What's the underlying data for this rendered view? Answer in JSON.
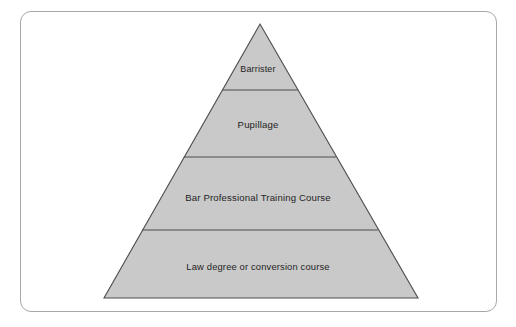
{
  "figure": {
    "kind": "pyramid-diagram",
    "title": "",
    "background_color": "#ffffff",
    "frame": {
      "border_color": "#a8a8a8",
      "corner_radius": 11,
      "fill_color": "#ffffff"
    },
    "pyramid": {
      "fill_color": "#c9c9c9",
      "outline_color": "#4d4d4d",
      "divider_color": "#4d4d4d",
      "apex": {
        "x": 260,
        "y": 24
      },
      "base_left": {
        "x": 104,
        "y": 298
      },
      "base_right": {
        "x": 418,
        "y": 298
      },
      "divider_y": [
        90,
        157,
        230
      ]
    },
    "tiers": [
      {
        "index": 0,
        "label": "Barrister",
        "position": "top"
      },
      {
        "index": 1,
        "label": "Pupillage",
        "position": "upper-middle"
      },
      {
        "index": 2,
        "label": "Bar Professional Training Course",
        "position": "lower-middle"
      },
      {
        "index": 3,
        "label": "Law degree or conversion course",
        "position": "base"
      }
    ]
  }
}
